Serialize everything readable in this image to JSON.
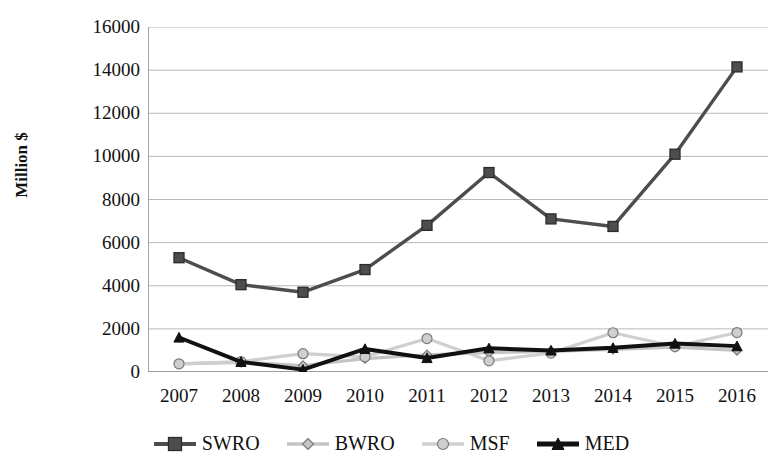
{
  "chart_data": {
    "type": "line",
    "title": "",
    "xlabel": "",
    "ylabel": "Million $",
    "categories": [
      "2007",
      "2008",
      "2009",
      "2010",
      "2011",
      "2012",
      "2013",
      "2014",
      "2015",
      "2016"
    ],
    "ylim": [
      0,
      16000
    ],
    "yticks": [
      0,
      2000,
      4000,
      6000,
      8000,
      10000,
      12000,
      14000,
      16000
    ],
    "ytick_labels": [
      "0",
      "2000",
      "4000",
      "6000",
      "8000",
      "10000",
      "12000",
      "14000",
      "16000"
    ],
    "grid": true,
    "legend_position": "bottom",
    "series": [
      {
        "name": "SWRO",
        "marker": "square",
        "color": "#4d4d4d",
        "values": [
          5300,
          4050,
          3700,
          4750,
          6800,
          9250,
          7100,
          6750,
          10100,
          14150
        ]
      },
      {
        "name": "BWRO",
        "marker": "diamond",
        "color": "#c4c4c4",
        "values": [
          380,
          450,
          300,
          620,
          800,
          900,
          950,
          1050,
          1150,
          1000
        ]
      },
      {
        "name": "MSF",
        "marker": "circle",
        "color": "#cfcfcf",
        "values": [
          380,
          480,
          850,
          700,
          1550,
          520,
          880,
          1820,
          1180,
          1830
        ]
      },
      {
        "name": "MED",
        "marker": "triangle",
        "color": "#111111",
        "values": [
          1600,
          470,
          110,
          1070,
          650,
          1100,
          1000,
          1120,
          1320,
          1200
        ]
      }
    ]
  },
  "legend": {
    "items": [
      {
        "label": "SWRO",
        "marker": "square-marker-icon"
      },
      {
        "label": "BWRO",
        "marker": "diamond-marker-icon"
      },
      {
        "label": "MSF",
        "marker": "circle-marker-icon"
      },
      {
        "label": "MED",
        "marker": "triangle-marker-icon"
      }
    ]
  }
}
